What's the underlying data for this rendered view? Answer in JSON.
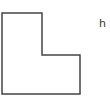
{
  "diagram": {
    "shape": {
      "type": "L-shaped polygon",
      "points": "2,13 42,13 42,55 80,55 80,94 2,94",
      "stroke": "#444444",
      "stroke_width": 1.5,
      "fill": "#ffffff"
    },
    "label": "h"
  }
}
